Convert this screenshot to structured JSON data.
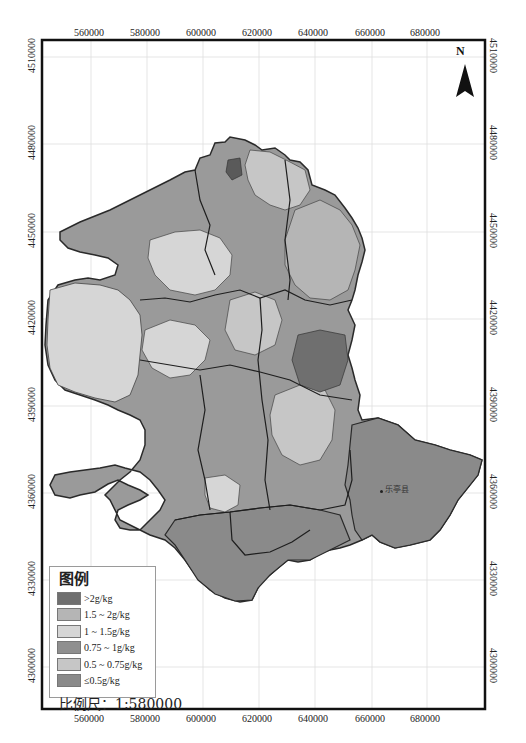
{
  "map": {
    "frame": {
      "left": 42,
      "top": 40,
      "right": 485,
      "bottom": 709
    },
    "x_ticks": [
      {
        "label": "560000",
        "x": 91
      },
      {
        "label": "580000",
        "x": 147
      },
      {
        "label": "600000",
        "x": 203
      },
      {
        "label": "620000",
        "x": 259
      },
      {
        "label": "640000",
        "x": 315
      },
      {
        "label": "660000",
        "x": 372
      },
      {
        "label": "680000",
        "x": 427
      }
    ],
    "y_ticks": [
      {
        "label": "4510000",
        "y": 57
      },
      {
        "label": "4480000",
        "y": 144
      },
      {
        "label": "4450000",
        "y": 232
      },
      {
        "label": "4420000",
        "y": 319
      },
      {
        "label": "4390000",
        "y": 406
      },
      {
        "label": "4360000",
        "y": 493
      },
      {
        "label": "4330000",
        "y": 580
      },
      {
        "label": "4300000",
        "y": 667
      }
    ],
    "north_label": "N",
    "place_labels": [
      {
        "label": "乐亭县",
        "x": 382,
        "y": 491
      }
    ],
    "colors": {
      "gt2": "#6f6f6f",
      "c1_5_2": "#b5b5b5",
      "c1_1_5": "#d6d6d6",
      "c075_1": "#8f8f8f",
      "c05_075": "#c6c6c6",
      "le05": "#8a8a8a",
      "boundary": "#2a2a2a"
    }
  },
  "legend": {
    "title": "图例",
    "items": [
      {
        "label": ">2g/kg",
        "color": "#6f6f6f"
      },
      {
        "label": "1.5 ~ 2g/kg",
        "color": "#b5b5b5"
      },
      {
        "label": "1 ~ 1.5g/kg",
        "color": "#d6d6d6"
      },
      {
        "label": "0.75 ~ 1g/kg",
        "color": "#8f8f8f"
      },
      {
        "label": "0.5 ~ 0.75g/kg",
        "color": "#c6c6c6"
      },
      {
        "label": "≤0.5g/kg",
        "color": "#8a8a8a"
      }
    ]
  },
  "scale": {
    "label": "比例尺：1:580000"
  }
}
